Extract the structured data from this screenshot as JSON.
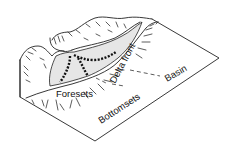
{
  "diagram": {
    "type": "block-diagram",
    "labels": {
      "foresets": "Foresets",
      "bottomsets": "Bottomsets",
      "delta_front": "Delta front",
      "basin": "Basin"
    },
    "colors": {
      "line": "#222222",
      "delta_fill": "#e6e6e6",
      "background": "#ffffff"
    }
  }
}
